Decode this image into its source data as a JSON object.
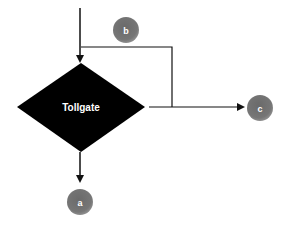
{
  "diagram": {
    "decision": {
      "label": "Tollgate",
      "color": "#000000"
    },
    "nodes": [
      {
        "id": "a",
        "label": "a"
      },
      {
        "id": "b",
        "label": "b"
      },
      {
        "id": "c",
        "label": "c"
      }
    ],
    "colors": {
      "circle": "#737373",
      "circle_edge": "#8a8a8a",
      "line": "#111111"
    }
  }
}
